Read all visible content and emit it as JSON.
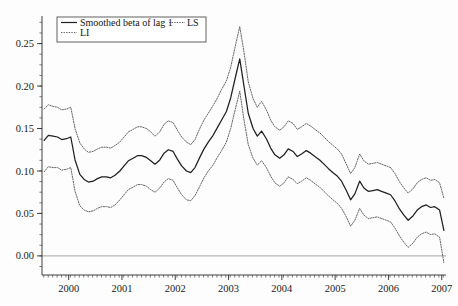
{
  "chart_data": {
    "type": "line",
    "title": "",
    "subtitle": "",
    "xlabel": "",
    "ylabel": "",
    "xlim": [
      1999.5,
      2007.08
    ],
    "ylim": [
      -0.0225,
      0.2825
    ],
    "grid": false,
    "legend_position": "top-left",
    "x_tick_labels": [
      "2000",
      "2001",
      "2002",
      "2003",
      "2004",
      "2005",
      "2006",
      "2007"
    ],
    "x_ticks": [
      2000,
      2001,
      2002,
      2003,
      2004,
      2005,
      2006,
      2007
    ],
    "x_minor_tick_interval": 0.0833,
    "y_tick_labels": [
      "0.00",
      "0.05",
      "0.10",
      "0.15",
      "0.20",
      "0.25"
    ],
    "y_ticks": [
      0.0,
      0.05,
      0.1,
      0.15,
      0.2,
      0.25
    ],
    "y_minor_tick_interval": 0.0125,
    "reference_lines": [
      0.0
    ],
    "legend": [
      {
        "label": "Smoothed beta of lag 1",
        "style": "solid",
        "series": "center"
      },
      {
        "label": "LS",
        "style": "dotted",
        "series": "upper"
      },
      {
        "label": "LI",
        "style": "dotted",
        "series": "lower"
      }
    ],
    "x": [
      1999.54,
      1999.62,
      1999.71,
      1999.79,
      1999.87,
      1999.96,
      2000.04,
      2000.12,
      2000.21,
      2000.29,
      2000.37,
      2000.46,
      2000.54,
      2000.62,
      2000.71,
      2000.79,
      2000.87,
      2000.96,
      2001.04,
      2001.12,
      2001.21,
      2001.29,
      2001.37,
      2001.46,
      2001.54,
      2001.62,
      2001.71,
      2001.79,
      2001.87,
      2001.96,
      2002.04,
      2002.12,
      2002.21,
      2002.29,
      2002.37,
      2002.46,
      2002.54,
      2002.62,
      2002.71,
      2002.79,
      2002.87,
      2002.96,
      2003.04,
      2003.12,
      2003.21,
      2003.29,
      2003.37,
      2003.46,
      2003.54,
      2003.62,
      2003.71,
      2003.79,
      2003.87,
      2003.96,
      2004.04,
      2004.12,
      2004.21,
      2004.29,
      2004.37,
      2004.46,
      2004.54,
      2004.62,
      2004.71,
      2004.79,
      2004.87,
      2004.96,
      2005.04,
      2005.12,
      2005.21,
      2005.29,
      2005.37,
      2005.46,
      2005.54,
      2005.62,
      2005.71,
      2005.79,
      2005.87,
      2005.96,
      2006.04,
      2006.12,
      2006.21,
      2006.29,
      2006.37,
      2006.46,
      2006.54,
      2006.62,
      2006.71,
      2006.79,
      2006.87,
      2006.96,
      2007.04
    ],
    "series": [
      {
        "name": "LS",
        "style": "dotted",
        "role": "upper-bound",
        "values": [
          0.173,
          0.178,
          0.176,
          0.175,
          0.172,
          0.173,
          0.175,
          0.15,
          0.133,
          0.126,
          0.122,
          0.123,
          0.126,
          0.128,
          0.128,
          0.127,
          0.13,
          0.134,
          0.14,
          0.146,
          0.149,
          0.152,
          0.152,
          0.15,
          0.146,
          0.141,
          0.146,
          0.155,
          0.159,
          0.157,
          0.148,
          0.14,
          0.134,
          0.131,
          0.137,
          0.15,
          0.16,
          0.168,
          0.177,
          0.186,
          0.196,
          0.206,
          0.222,
          0.245,
          0.27,
          0.24,
          0.205,
          0.185,
          0.175,
          0.182,
          0.172,
          0.16,
          0.152,
          0.148,
          0.152,
          0.159,
          0.156,
          0.149,
          0.152,
          0.156,
          0.153,
          0.149,
          0.145,
          0.14,
          0.135,
          0.13,
          0.126,
          0.12,
          0.108,
          0.097,
          0.104,
          0.12,
          0.112,
          0.108,
          0.109,
          0.11,
          0.108,
          0.106,
          0.104,
          0.097,
          0.087,
          0.08,
          0.074,
          0.079,
          0.086,
          0.09,
          0.092,
          0.089,
          0.09,
          0.086,
          0.068
        ]
      },
      {
        "name": "Smoothed beta of lag 1",
        "style": "solid",
        "role": "center",
        "values": [
          0.136,
          0.142,
          0.141,
          0.14,
          0.137,
          0.138,
          0.14,
          0.113,
          0.096,
          0.09,
          0.087,
          0.088,
          0.091,
          0.093,
          0.093,
          0.092,
          0.095,
          0.1,
          0.106,
          0.112,
          0.115,
          0.118,
          0.118,
          0.116,
          0.112,
          0.108,
          0.113,
          0.121,
          0.125,
          0.123,
          0.114,
          0.106,
          0.1,
          0.098,
          0.104,
          0.116,
          0.126,
          0.134,
          0.142,
          0.151,
          0.16,
          0.17,
          0.186,
          0.208,
          0.232,
          0.2,
          0.168,
          0.15,
          0.141,
          0.147,
          0.138,
          0.127,
          0.119,
          0.115,
          0.119,
          0.126,
          0.123,
          0.117,
          0.12,
          0.124,
          0.121,
          0.117,
          0.113,
          0.108,
          0.103,
          0.098,
          0.094,
          0.088,
          0.077,
          0.066,
          0.073,
          0.088,
          0.08,
          0.076,
          0.077,
          0.078,
          0.076,
          0.074,
          0.072,
          0.065,
          0.055,
          0.048,
          0.042,
          0.047,
          0.054,
          0.058,
          0.06,
          0.057,
          0.058,
          0.054,
          0.03
        ]
      },
      {
        "name": "LI",
        "style": "dotted",
        "role": "lower-bound",
        "values": [
          0.099,
          0.105,
          0.104,
          0.104,
          0.101,
          0.102,
          0.104,
          0.076,
          0.059,
          0.054,
          0.052,
          0.053,
          0.056,
          0.058,
          0.058,
          0.057,
          0.06,
          0.066,
          0.072,
          0.078,
          0.081,
          0.084,
          0.084,
          0.082,
          0.078,
          0.075,
          0.08,
          0.087,
          0.091,
          0.089,
          0.08,
          0.072,
          0.066,
          0.065,
          0.071,
          0.082,
          0.092,
          0.1,
          0.107,
          0.116,
          0.124,
          0.134,
          0.15,
          0.171,
          0.194,
          0.16,
          0.131,
          0.115,
          0.107,
          0.112,
          0.104,
          0.094,
          0.086,
          0.082,
          0.086,
          0.093,
          0.09,
          0.085,
          0.088,
          0.092,
          0.089,
          0.085,
          0.081,
          0.076,
          0.071,
          0.066,
          0.062,
          0.056,
          0.046,
          0.035,
          0.042,
          0.056,
          0.048,
          0.044,
          0.045,
          0.046,
          0.044,
          0.042,
          0.04,
          0.033,
          0.023,
          0.016,
          0.01,
          0.015,
          0.022,
          0.026,
          0.028,
          0.025,
          0.026,
          0.022,
          -0.008
        ]
      }
    ]
  },
  "legend": {
    "entry_center": "Smoothed beta of lag 1",
    "entry_upper": "LS",
    "entry_lower": "LI"
  },
  "axes": {
    "y_labels": [
      "0.25",
      "0.20",
      "0.15",
      "0.10",
      "0.05",
      "0.00"
    ],
    "x_labels": [
      "2000",
      "2001",
      "2002",
      "2003",
      "2004",
      "2005",
      "2006",
      "2007"
    ]
  }
}
